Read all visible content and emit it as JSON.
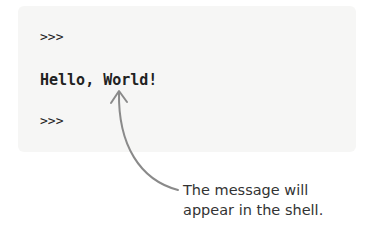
{
  "shell": {
    "lines": [
      ">>>",
      "Hello, World!",
      ">>>"
    ]
  },
  "annotation": {
    "line1": "The message will",
    "line2": "appear in the shell."
  },
  "colors": {
    "panel": "#f6f6f5",
    "arrow": "#8a8a8a",
    "text": "#222222"
  }
}
